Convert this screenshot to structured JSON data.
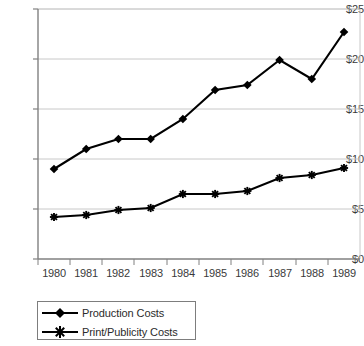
{
  "chart_data": {
    "type": "line",
    "title": "",
    "subtitle": "",
    "xlabel": "",
    "ylabel": "",
    "categories": [
      "1980",
      "1981",
      "1982",
      "1983",
      "1984",
      "1985",
      "1986",
      "1987",
      "1988",
      "1989"
    ],
    "series": [
      {
        "name": "Production Costs",
        "marker": "diamond",
        "values": [
          9.0,
          11.0,
          12.0,
          12.0,
          14.0,
          16.9,
          17.4,
          19.9,
          18.0,
          22.7
        ]
      },
      {
        "name": "Print/Publicity Costs",
        "marker": "star",
        "values": [
          4.2,
          4.4,
          4.9,
          5.1,
          6.5,
          6.5,
          6.8,
          8.1,
          8.4,
          9.1
        ]
      }
    ],
    "ylim": [
      0,
      25
    ],
    "ytick_values": [
      0,
      5,
      10,
      15,
      20,
      25
    ],
    "ytick_labels": [
      "$0",
      "$5",
      "$10",
      "$15",
      "$20",
      "$25"
    ],
    "grid": "horizontal",
    "legend_position": "bottom-left",
    "line_color": "#000000",
    "grid_color": "#c8c8c8",
    "axis_color": "#808080",
    "background": "#ffffff"
  },
  "legend": {
    "entries": [
      {
        "label": "Production Costs"
      },
      {
        "label": "Print/Publicity Costs"
      }
    ]
  }
}
